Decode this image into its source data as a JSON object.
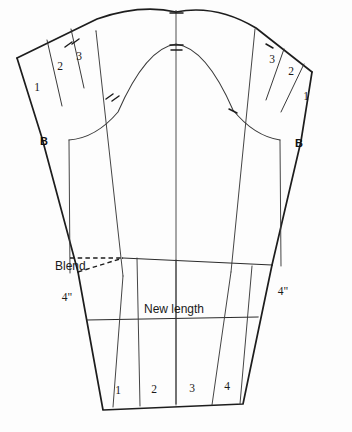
{
  "figure": {
    "kind": "sleeve-pattern-draft",
    "background_color": "#fdfdfd",
    "line_color": "#1d1d1d"
  },
  "labels": {
    "blend": "Blend",
    "new_length": "New length",
    "inch_left": "4\"",
    "inch_right": "4\"",
    "point_b_left": "B",
    "point_b_right": "B"
  },
  "left_wedges": [
    {
      "label": "1"
    },
    {
      "label": "2"
    },
    {
      "label": "3"
    }
  ],
  "right_wedges": [
    {
      "label": "3"
    },
    {
      "label": "2"
    },
    {
      "label": "1"
    }
  ],
  "hem_sections": [
    {
      "label": "1"
    },
    {
      "label": "2"
    },
    {
      "label": "3"
    },
    {
      "label": "4"
    }
  ],
  "notches": {
    "center_top": "double-notch",
    "center_inner": "double-notch",
    "left_cap": "double-notch",
    "left_inner": "double-notch",
    "right_cap": "single-notch",
    "right_inner": "single-notch"
  }
}
